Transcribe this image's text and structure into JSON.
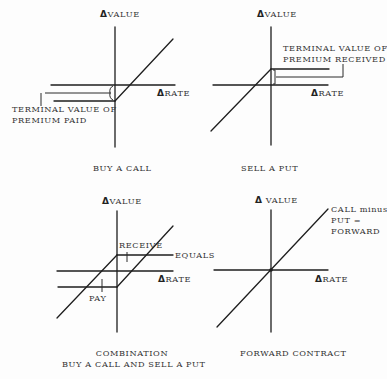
{
  "figure": {
    "panels": [
      {
        "id": "buy-call",
        "title": "BUY A CALL",
        "y_axis_label": "VALUE",
        "x_axis_label": "RATE",
        "delta_symbol": "Δ",
        "annotation": [
          "TERMINAL VALUE OF",
          "PREMIUM PAID"
        ]
      },
      {
        "id": "sell-put",
        "title": "SELL A PUT",
        "y_axis_label": "VALUE",
        "x_axis_label": "RATE",
        "delta_symbol": "Δ",
        "annotation": [
          "TERMINAL VALUE OF",
          "PREMIUM RECEIVED"
        ]
      },
      {
        "id": "combination",
        "title": [
          "COMBINATION",
          "BUY A CALL AND SELL A PUT"
        ],
        "y_axis_label": "VALUE",
        "x_axis_label": "RATE",
        "delta_symbol": "Δ",
        "annotations": {
          "receive": "RECEIVE",
          "pay": "PAY",
          "equals": "EQUALS"
        }
      },
      {
        "id": "forward-contract",
        "title": "FORWARD CONTRACT",
        "y_axis_label": "VALUE",
        "x_axis_label": "RATE",
        "delta_symbol": "Δ",
        "annotation": [
          "CALL minus",
          "PUT =",
          "FORWARD"
        ]
      }
    ],
    "colors": {
      "ink": "#1e1e1e",
      "text": "#333333",
      "background": "#fdfdfd"
    }
  },
  "geometry": {
    "lines": [
      {
        "p": "q1-y-axis",
        "x1": 115,
        "y1": 27,
        "x2": 115,
        "y2": 147
      },
      {
        "p": "q1-x-axis",
        "x1": 51,
        "y1": 85,
        "x2": 175,
        "y2": 85
      },
      {
        "p": "q1-premium-line",
        "x1": 54,
        "y1": 101,
        "x2": 115,
        "y2": 101
      },
      {
        "p": "q1-payoff-diagonal",
        "x1": 115,
        "y1": 101,
        "x2": 173,
        "y2": 39
      },
      {
        "p": "q1-leader",
        "x1": 45,
        "y1": 93,
        "x2": 111,
        "y2": 93
      },
      {
        "p": "q1-leader-tick",
        "x1": 41,
        "y1": 93,
        "x2": 41,
        "y2": 106
      },
      {
        "p": "q2-y-axis",
        "x1": 271,
        "y1": 27,
        "x2": 271,
        "y2": 145
      },
      {
        "p": "q2-x-axis",
        "x1": 213,
        "y1": 85,
        "x2": 328,
        "y2": 85
      },
      {
        "p": "q2-premium-line",
        "x1": 271,
        "y1": 69,
        "x2": 329,
        "y2": 69
      },
      {
        "p": "q2-payoff-diagonal",
        "x1": 211,
        "y1": 131,
        "x2": 271,
        "y2": 69
      },
      {
        "p": "q2-leader",
        "x1": 276,
        "y1": 77,
        "x2": 343,
        "y2": 77
      },
      {
        "p": "q2-leader-tick",
        "x1": 343,
        "y1": 64,
        "x2": 343,
        "y2": 77
      },
      {
        "p": "q3-y-axis",
        "x1": 117,
        "y1": 211,
        "x2": 117,
        "y2": 332
      },
      {
        "p": "q3-x-axis",
        "x1": 57,
        "y1": 271,
        "x2": 173,
        "y2": 271
      },
      {
        "p": "q3-receive-line",
        "x1": 117,
        "y1": 255,
        "x2": 173,
        "y2": 255
      },
      {
        "p": "q3-pay-line",
        "x1": 58,
        "y1": 287,
        "x2": 117,
        "y2": 287
      },
      {
        "p": "q3-diagonal-a",
        "x1": 57,
        "y1": 318,
        "x2": 117,
        "y2": 255
      },
      {
        "p": "q3-diagonal-b",
        "x1": 117,
        "y1": 287,
        "x2": 173,
        "y2": 226
      },
      {
        "p": "q3-receive-arrow",
        "x1": 127,
        "y1": 252,
        "x2": 127,
        "y2": 262
      },
      {
        "p": "q3-pay-arrow",
        "x1": 102,
        "y1": 279,
        "x2": 102,
        "y2": 292
      },
      {
        "p": "q4-y-axis",
        "x1": 271,
        "y1": 210,
        "x2": 271,
        "y2": 332
      },
      {
        "p": "q4-x-axis",
        "x1": 214,
        "y1": 270,
        "x2": 328,
        "y2": 270
      },
      {
        "p": "q4-forward-diagonal",
        "x1": 217,
        "y1": 327,
        "x2": 328,
        "y2": 209
      }
    ]
  }
}
